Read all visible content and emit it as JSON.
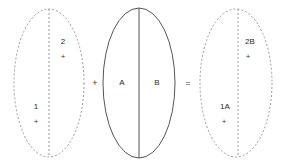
{
  "canvas": {
    "width": 290,
    "height": 166,
    "background": "#ffffff"
  },
  "style": {
    "dashed_stroke": "#9a9a9a",
    "solid_stroke": "#555555",
    "text_color": "#2b2b2b",
    "dash_pattern": "2 2"
  },
  "equation": {
    "operator_plus": "+",
    "operator_equals": "="
  },
  "shapes": {
    "ellipse_left": {
      "name": "gamete-ellipse-left",
      "stroke_style": "dashed",
      "center_line_style": "dashed",
      "cx": 49,
      "cy": 83,
      "rx": 35,
      "ry": 74,
      "labels": {
        "top": "2",
        "top_plus": "+",
        "bottom": "1",
        "bottom_plus": "+"
      }
    },
    "ellipse_middle": {
      "name": "gamete-ellipse-middle",
      "stroke_style": "solid",
      "center_line_style": "solid",
      "cx": 139,
      "cy": 83,
      "rx": 36,
      "ry": 75,
      "labels": {
        "left": "A",
        "right": "B"
      }
    },
    "ellipse_right": {
      "name": "gamete-ellipse-right",
      "stroke_style": "dashed",
      "center_line_style": "dashed",
      "cx": 236,
      "cy": 83,
      "rx": 36,
      "ry": 74,
      "labels": {
        "top": "2B",
        "top_plus": "+",
        "bottom": "1A",
        "bottom_plus": "+"
      }
    }
  }
}
